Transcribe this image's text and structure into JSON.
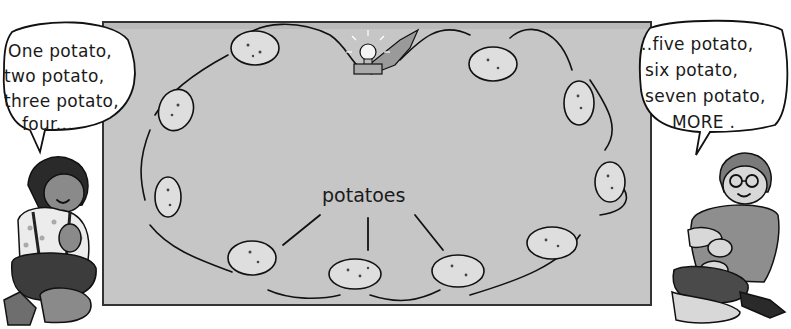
{
  "illustration": {
    "board": {
      "color": "#c4c4c4",
      "border": "#3a3a3a"
    },
    "left_bubble": {
      "lines": [
        "One potato,",
        "two potato,",
        "three potato,",
        "four..."
      ]
    },
    "right_bubble": {
      "lines": [
        "..five potato,",
        "six potato,",
        "seven potato,",
        "MORE ."
      ]
    },
    "label": "potatoes",
    "colors": {
      "skin": "#8a8a8a",
      "potato": "#dcdcdc",
      "girl_skirt": "#3c3c3c",
      "boy_shirt": "#8e8e8e",
      "boy_shorts": "#4a4a4a",
      "hair": "#2a2a2a"
    },
    "potato_count": 11,
    "light_bulb": "light-bulb-icon"
  }
}
